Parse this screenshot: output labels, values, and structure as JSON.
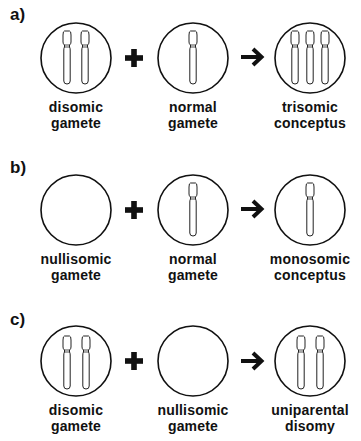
{
  "panels": [
    {
      "label": "a)",
      "left": {
        "line1": "disomic",
        "line2": "gamete",
        "chromosomes": 2
      },
      "operator": "plus",
      "middle": {
        "line1": "normal",
        "line2": "gamete",
        "chromosomes": 1
      },
      "result_operator": "arrow",
      "right": {
        "line1": "trisomic",
        "line2": "conceptus",
        "chromosomes": 3
      }
    },
    {
      "label": "b)",
      "left": {
        "line1": "nullisomic",
        "line2": "gamete",
        "chromosomes": 0
      },
      "operator": "plus",
      "middle": {
        "line1": "normal",
        "line2": "gamete",
        "chromosomes": 1
      },
      "result_operator": "arrow",
      "right": {
        "line1": "monosomic",
        "line2": "conceptus",
        "chromosomes": 1
      }
    },
    {
      "label": "c)",
      "left": {
        "line1": "disomic",
        "line2": "gamete",
        "chromosomes": 2
      },
      "operator": "plus",
      "middle": {
        "line1": "nullisomic",
        "line2": "gamete",
        "chromosomes": 0
      },
      "result_operator": "arrow",
      "right": {
        "line1": "uniparental",
        "line2": "disomy",
        "chromosomes": 2
      }
    }
  ]
}
